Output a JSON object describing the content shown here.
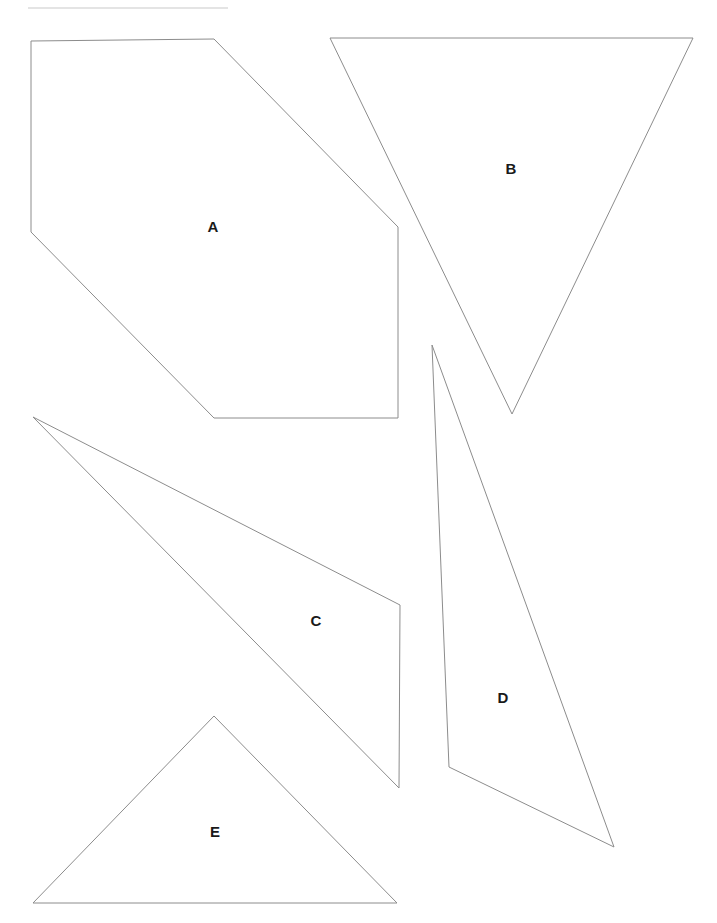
{
  "page": {
    "width": 717,
    "height": 923,
    "background_color": "#ffffff",
    "stroke_color": "#8c8c8c",
    "label_color": "#1a1a1a",
    "divider_color": "#c9c9c9"
  },
  "divider": {
    "name": "top-horizontal-rule",
    "x1": 28,
    "y1": 8,
    "x2": 228,
    "y2": 8
  },
  "chart_data": {
    "type": "diagram",
    "title": "",
    "shape_count": 5,
    "shapes": [
      {
        "label": "A",
        "kind": "hexagon",
        "sides": 6,
        "points": "31,41 214,39 398,227 398,418 214,418 31,232",
        "label_x": 213,
        "label_y": 228
      },
      {
        "label": "B",
        "kind": "triangle",
        "sides": 3,
        "points": "330,38 693,38 512,414",
        "label_x": 511,
        "label_y": 170
      },
      {
        "label": "C",
        "kind": "quadrilateral",
        "sides": 4,
        "points": "33,417 400,605 399,788 33,417",
        "label_x": 316,
        "label_y": 622
      },
      {
        "label": "D",
        "kind": "triangle",
        "sides": 3,
        "points": "432,345 614,847 449,767",
        "label_x": 503,
        "label_y": 699
      },
      {
        "label": "E",
        "kind": "triangle",
        "sides": 3,
        "points": "214,716 397,903 33,903",
        "label_x": 215,
        "label_y": 833
      }
    ]
  }
}
